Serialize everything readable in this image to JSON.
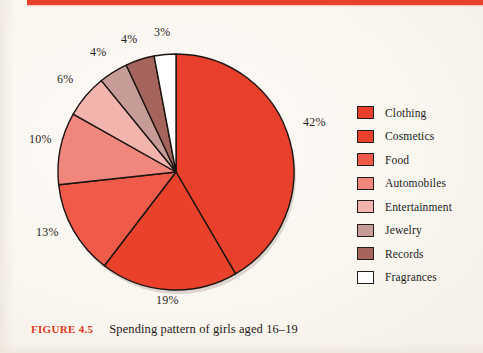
{
  "figure": {
    "number_label": "FIGURE 4.5",
    "caption": "Spending pattern of girls aged 16–19",
    "rule_color": "#e8402a",
    "background_color": "#faf6f0"
  },
  "legend": {
    "items": [
      {
        "label": "Clothing",
        "color": "#e8402a"
      },
      {
        "label": "Cosmetics",
        "color": "#ea412b"
      },
      {
        "label": "Food",
        "color": "#f05a48"
      },
      {
        "label": "Automobiles",
        "color": "#f0867c"
      },
      {
        "label": "Entertainment",
        "color": "#f2b4ad"
      },
      {
        "label": "Jewelry",
        "color": "#c79b96"
      },
      {
        "label": "Records",
        "color": "#a5655c"
      },
      {
        "label": "Fragrances",
        "color": "#ffffff"
      }
    ]
  },
  "labels": {
    "clothing_pct": "42%",
    "cosmetics_pct": "19%",
    "food_pct": "13%",
    "automobiles_pct": "10%",
    "entertainment_pct": "6%",
    "jewelry_pct": "4%",
    "records_pct": "4%",
    "fragrances_pct": "3%"
  },
  "chart_data": {
    "type": "pie",
    "title": "Spending pattern of girls aged 16–19",
    "xlabel": "",
    "ylabel": "",
    "legend_position": "right",
    "grid": false,
    "start_angle_deg": 0,
    "direction": "clockwise",
    "units": "percent",
    "categories": [
      "Clothing",
      "Cosmetics",
      "Food",
      "Automobiles",
      "Entertainment",
      "Jewelry",
      "Records",
      "Fragrances"
    ],
    "values": [
      42,
      19,
      13,
      10,
      6,
      4,
      4,
      3
    ],
    "colors": [
      "#e8402a",
      "#ea412b",
      "#f05a48",
      "#f0867c",
      "#f2b4ad",
      "#c79b96",
      "#a5655c",
      "#ffffff"
    ],
    "data_labels": [
      "42%",
      "19%",
      "13%",
      "10%",
      "6%",
      "4%",
      "4%",
      "3%"
    ],
    "total": 101
  }
}
